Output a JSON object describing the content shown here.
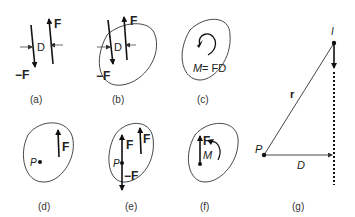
{
  "figure": {
    "panels": [
      {
        "id": "a",
        "caption": "(a)",
        "labels": {
          "force_up": "F",
          "force_down": "−F",
          "distance": "D"
        }
      },
      {
        "id": "b",
        "caption": "(b)",
        "labels": {
          "force_up": "F",
          "force_down": "−F",
          "distance": "D"
        }
      },
      {
        "id": "c",
        "caption": "(c)",
        "labels": {
          "moment_eq_M": "M",
          "moment_eq_rest": " = FD"
        }
      },
      {
        "id": "d",
        "caption": "(d)",
        "labels": {
          "point": "P",
          "force": "F"
        }
      },
      {
        "id": "e",
        "caption": "(e)",
        "labels": {
          "point": "P",
          "force_at_p": "F",
          "force_neg": "−F",
          "force": "F"
        }
      },
      {
        "id": "f",
        "caption": "(f)",
        "labels": {
          "force": "F",
          "moment": "M"
        }
      },
      {
        "id": "g",
        "caption": "(g)",
        "labels": {
          "impulse": "I",
          "radius": "r",
          "point": "P",
          "distance": "D"
        }
      }
    ]
  }
}
